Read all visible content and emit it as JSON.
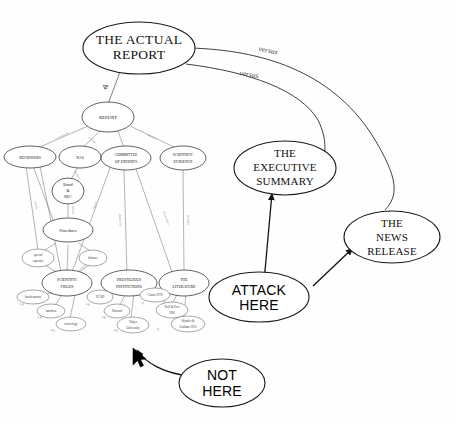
{
  "diagram": {
    "background_color": "#fefefe",
    "stroke_color": "#2b2b2b"
  },
  "nodes": {
    "actual_report": "THE ACTUAL REPORT",
    "actual_report_l1": "THE ACTUAL",
    "actual_report_l2": "REPORT",
    "executive_summary_l1": "THE",
    "executive_summary_l2": "EXECUTIVE",
    "executive_summary_l3": "SUMMARY",
    "news_release_l1": "THE",
    "news_release_l2": "NEWS",
    "news_release_l3": "RELEASE",
    "attack_here_l1": "ATTACK",
    "attack_here_l2": "HERE",
    "not_here_l1": "NOT",
    "not_here_l2": "HERE",
    "report": "REPORT",
    "reviewers": "REVIEWERS",
    "nas": "NAS",
    "committee_l1": "COMMITTEE",
    "committee_l2": "OF EXPERTS",
    "scientific_evidence_l1": "SCIENTIFIC",
    "scientific_evidence_l2": "EVIDENCE",
    "board_l1": "Board",
    "board_l2": "&",
    "board_l3": "REC",
    "procedures": "Procedures",
    "special_expertise_l1": "special",
    "special_expertise_l2": "expertise",
    "balance": "balance",
    "scientific_fields_l1": "SCIENTIFIC",
    "scientific_fields_l2": "FIELDS",
    "prestigious_l1": "PRESTIGIOUS",
    "prestigious_l2": "INSTITUTIONS",
    "literature_l1": "THE",
    "literature_l2": "LITERATURE",
    "biochemistry": "biochemistry",
    "nutrition": "nutrition",
    "toxicology": "toxicology",
    "ucsd": "UCSD",
    "harvard": "Harvard",
    "tokyo_l1": "Tokyo",
    "tokyo_l2": "University",
    "cairns": "Cairns 1978",
    "doll_peto_l1": "Doll & Peto",
    "doll_peto_l2": "1981",
    "wynder_l1": "Wynder &",
    "wynder_l2": "Graham 1950"
  },
  "edge_labels": {
    "versus_top": "versus",
    "versus_bottom": "versus",
    "ampersand": "&",
    "is_written_by": "is written by",
    "is_from": "is from",
    "assesses": "assesses",
    "appoints": "appoints",
    "follows": "follows",
    "require": "require",
    "require_2": "require",
    "chosen_for": "chosen for",
    "drawn_from": "drawn from",
    "includes": "includes",
    "such_as": "such as",
    "eg_1": "e.g.",
    "eg_2": "e.g.",
    "eg_3": "e.g.",
    "eg_4": "e.g.",
    "eg_5": "e.g.",
    "eg_6": "e.g.",
    "cfr_1": "cf.",
    "cfr_2": "cf."
  },
  "cursor": {
    "name": "mouse-pointer",
    "x": 133,
    "y": 352
  }
}
